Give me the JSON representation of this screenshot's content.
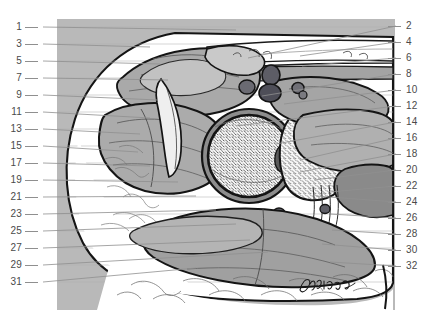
{
  "figure": {
    "signature": "Müller",
    "plate_background_color": "#b9b9b9",
    "page_background_color": "#ffffff",
    "ink_color": "#1a1a1a",
    "leader_color": "#8f8f8f",
    "label_color": "#4a4a4a"
  },
  "labels": {
    "left_column": [
      {
        "number": "1",
        "y": 27
      },
      {
        "number": "3",
        "y": 44
      },
      {
        "number": "5",
        "y": 61
      },
      {
        "number": "7",
        "y": 78
      },
      {
        "number": "9",
        "y": 95
      },
      {
        "number": "11",
        "y": 112
      },
      {
        "number": "13",
        "y": 129
      },
      {
        "number": "15",
        "y": 146
      },
      {
        "number": "17",
        "y": 163
      },
      {
        "number": "19",
        "y": 180
      },
      {
        "number": "21",
        "y": 197
      },
      {
        "number": "23",
        "y": 214
      },
      {
        "number": "25",
        "y": 231
      },
      {
        "number": "27",
        "y": 248
      },
      {
        "number": "29",
        "y": 265
      },
      {
        "number": "31",
        "y": 282
      }
    ],
    "right_column": [
      {
        "number": "2",
        "y": 26
      },
      {
        "number": "4",
        "y": 42
      },
      {
        "number": "6",
        "y": 58
      },
      {
        "number": "8",
        "y": 74
      },
      {
        "number": "10",
        "y": 90
      },
      {
        "number": "12",
        "y": 106
      },
      {
        "number": "14",
        "y": 122
      },
      {
        "number": "16",
        "y": 138
      },
      {
        "number": "18",
        "y": 154
      },
      {
        "number": "20",
        "y": 170
      },
      {
        "number": "22",
        "y": 186
      },
      {
        "number": "24",
        "y": 202
      },
      {
        "number": "26",
        "y": 218
      },
      {
        "number": "28",
        "y": 234
      },
      {
        "number": "30",
        "y": 250
      },
      {
        "number": "32",
        "y": 266
      }
    ]
  }
}
